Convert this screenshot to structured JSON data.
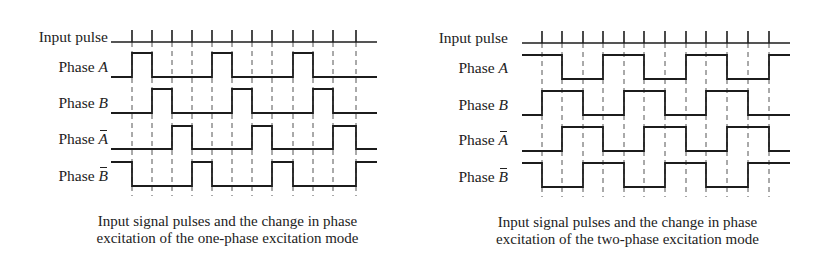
{
  "figure": {
    "panels": [
      {
        "id": "one-phase",
        "labels": {
          "input": "Input pulse",
          "phase_word": "Phase",
          "a": "A",
          "b": "B",
          "a_bar": "A",
          "b_bar": "B"
        },
        "caption_line1": "Input signal pulses and the change in phase",
        "caption_line2": "excitation of the one-phase excitation mode",
        "geometry": {
          "x_start": 111,
          "x_end": 377,
          "ticks": [
            132,
            152,
            172,
            192,
            212,
            232,
            252,
            272,
            293,
            313,
            333,
            356
          ],
          "input_y": 42,
          "tick_top": 30,
          "dash_bottom": 196,
          "rows": [
            {
              "name": "A",
              "high": 53,
              "low": 77
            },
            {
              "name": "B",
              "high": 89,
              "low": 113
            },
            {
              "name": "Abar",
              "high": 126,
              "low": 149
            },
            {
              "name": "Bbar",
              "high": 162,
              "low": 186
            }
          ]
        },
        "waveforms": {
          "A": [
            0,
            1,
            0,
            0,
            0,
            1,
            0,
            0,
            0,
            1,
            0,
            0,
            0
          ],
          "B": [
            0,
            0,
            1,
            0,
            0,
            0,
            1,
            0,
            0,
            0,
            1,
            0,
            0
          ],
          "Abar": [
            0,
            0,
            0,
            1,
            0,
            0,
            0,
            1,
            0,
            0,
            0,
            1,
            0
          ],
          "Bbar": [
            1,
            0,
            0,
            0,
            1,
            0,
            0,
            0,
            1,
            0,
            0,
            0,
            1
          ]
        }
      },
      {
        "id": "two-phase",
        "labels": {
          "input": "Input pulse",
          "phase_word": "Phase",
          "a": "A",
          "b": "B",
          "a_bar": "A",
          "b_bar": "B"
        },
        "caption_line1": "Input signal pulses and the change in phase",
        "caption_line2": "excitation of the two-phase excitation mode",
        "geometry": {
          "x_start": 522,
          "x_end": 790,
          "ticks": [
            542,
            562,
            583,
            603,
            624,
            644,
            665,
            686,
            706,
            727,
            748,
            769
          ],
          "input_y": 43,
          "tick_top": 31,
          "dash_bottom": 197,
          "rows": [
            {
              "name": "A",
              "high": 55,
              "low": 79
            },
            {
              "name": "B",
              "high": 91,
              "low": 115
            },
            {
              "name": "Abar",
              "high": 127,
              "low": 151
            },
            {
              "name": "Bbar",
              "high": 163,
              "low": 187
            }
          ]
        },
        "waveforms": {
          "A": [
            1,
            1,
            0,
            0,
            1,
            1,
            0,
            0,
            1,
            1,
            0,
            0,
            1
          ],
          "B": [
            0,
            1,
            1,
            0,
            0,
            1,
            1,
            0,
            0,
            1,
            1,
            0,
            0
          ],
          "Abar": [
            0,
            0,
            1,
            1,
            0,
            0,
            1,
            1,
            0,
            0,
            1,
            1,
            0
          ],
          "Bbar": [
            1,
            0,
            0,
            1,
            1,
            0,
            0,
            1,
            1,
            0,
            0,
            1,
            1
          ]
        }
      }
    ],
    "colors": {
      "line": "#1c1c1c",
      "dash": "#555555",
      "background": "#ffffff"
    }
  }
}
